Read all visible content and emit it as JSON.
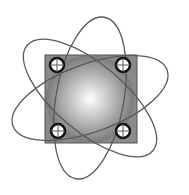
{
  "diagram": {
    "title": "",
    "colors": {
      "background": "#ffffff",
      "square_fill": "#8a8a8a",
      "sphere_center": "#ffffff",
      "sphere_edge": "#7a7a7a",
      "orbit_stroke": "#5a5a5a",
      "corner_circle_stroke": "#111111",
      "corner_circle_fill": "#ffffff"
    },
    "square": {
      "x": 45,
      "y": 55,
      "width": 92,
      "height": 88
    },
    "sphere": {
      "cx": 90,
      "cy": 99,
      "r": 44
    },
    "orbits": [
      {
        "cx": 90,
        "cy": 98,
        "rx": 82,
        "ry": 34,
        "rotation": -20
      },
      {
        "cx": 90,
        "cy": 98,
        "rx": 82,
        "ry": 34,
        "rotation": 40
      },
      {
        "cx": 90,
        "cy": 98,
        "rx": 82,
        "ry": 34,
        "rotation": 100
      }
    ],
    "corner_circles": [
      {
        "name": "top-left",
        "cx": 57,
        "cy": 65,
        "r": 7
      },
      {
        "name": "top-right",
        "cx": 123,
        "cy": 65,
        "r": 7
      },
      {
        "name": "bottom-left",
        "cx": 58,
        "cy": 131,
        "r": 7
      },
      {
        "name": "bottom-right",
        "cx": 123,
        "cy": 131,
        "r": 7
      }
    ]
  }
}
